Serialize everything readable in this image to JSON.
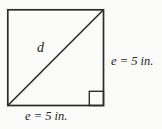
{
  "figure": {
    "type": "geometry-diagram",
    "shape": "square-with-diagonal",
    "diagonal_label": "d",
    "right_side_label": "e = 5 in.",
    "bottom_side_label": "e = 5 in.",
    "side_length_value": 5,
    "side_length_unit": "in.",
    "right_angle_marker": true,
    "colors": {
      "line": "#2b2b2b",
      "background": "#fbfbf9",
      "text": "#1f1f1f"
    }
  }
}
